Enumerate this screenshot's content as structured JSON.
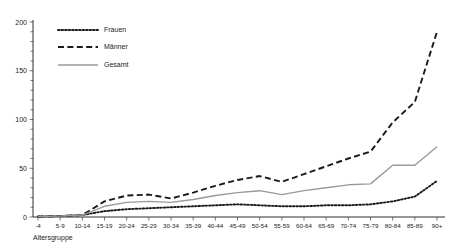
{
  "chart_data": {
    "type": "line",
    "title": "",
    "xlabel": "Altersgruppe",
    "ylabel": "",
    "ylim": [
      0,
      200
    ],
    "yticks": [
      0,
      50,
      100,
      150,
      200
    ],
    "yticklabels": [
      "0",
      "50",
      "100",
      "150",
      "200"
    ],
    "grid": false,
    "legend_position": "top-left",
    "categories": [
      "-4",
      "5-9",
      "10-14",
      "15-19",
      "20-24",
      "25-29",
      "30-34",
      "35-39",
      "40-44",
      "45-49",
      "50-54",
      "55-59",
      "60-64",
      "65-69",
      "70-74",
      "75-79",
      "80-84",
      "85-89",
      "90+"
    ],
    "series": [
      {
        "name": "Frauen",
        "style": "dotted",
        "color": "#1a1a1a",
        "values": [
          0.5,
          1,
          2,
          6,
          8,
          9,
          10,
          11,
          12,
          13,
          12,
          11,
          11,
          12,
          12,
          13,
          16,
          21,
          37
        ]
      },
      {
        "name": "Männer",
        "style": "dashed",
        "color": "#1a1a1a",
        "values": [
          0.5,
          1,
          2,
          16,
          22,
          23,
          19,
          25,
          32,
          38,
          42,
          36,
          44,
          52,
          60,
          67,
          97,
          118,
          190
        ]
      },
      {
        "name": "Gesamt",
        "style": "solid",
        "color": "#9a9a9a",
        "values": [
          0.5,
          1,
          2,
          11,
          15,
          16,
          15,
          18,
          22,
          25,
          27,
          23,
          27,
          30,
          33,
          34,
          53,
          53,
          72
        ]
      }
    ]
  },
  "legend": {
    "items": [
      {
        "label": "Frauen"
      },
      {
        "label": "Männer"
      },
      {
        "label": "Gesamt"
      }
    ]
  },
  "axes": {
    "x_title": "Altersgruppe"
  }
}
